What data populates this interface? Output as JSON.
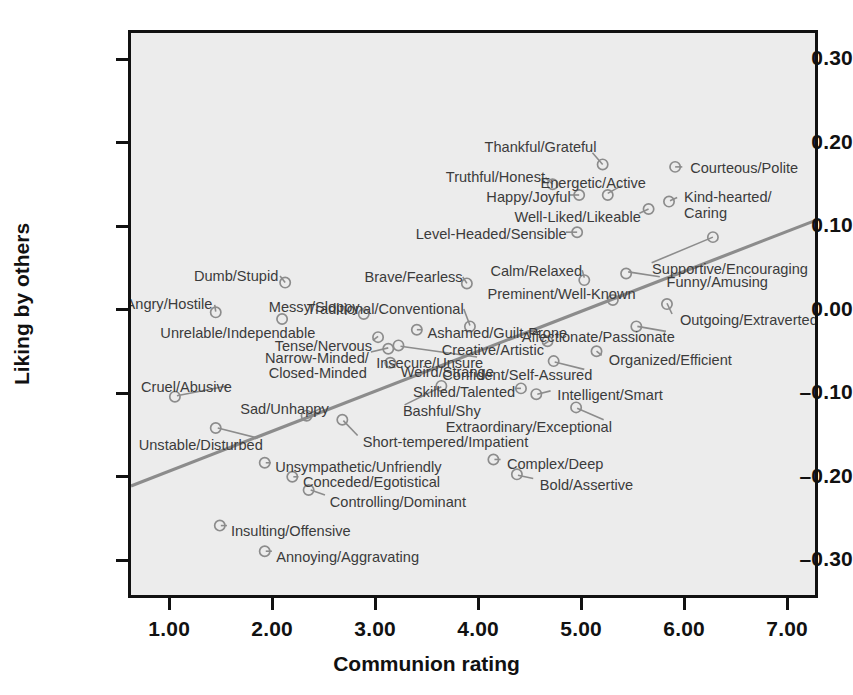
{
  "chart_data": {
    "type": "scatter",
    "title": "",
    "xlabel": "Communion rating",
    "ylabel": "Liking by others",
    "xlim": [
      0.6,
      7.3
    ],
    "ylim": [
      -0.345,
      0.335
    ],
    "xticks": [
      "1.00",
      "2.00",
      "3.00",
      "4.00",
      "5.00",
      "6.00",
      "7.00"
    ],
    "xtick_values": [
      1,
      2,
      3,
      4,
      5,
      6,
      7
    ],
    "yticks": [
      "0.30",
      "0.20",
      "0.10",
      "0.00",
      "-0.10",
      "-0.20",
      "-0.30"
    ],
    "ytick_values": [
      0.3,
      0.2,
      0.1,
      0.0,
      -0.1,
      -0.2,
      -0.3
    ],
    "grid": false,
    "legend": "none",
    "marker": "open-circle",
    "marker_color": "#8c8c8c",
    "plot_background": "#ececec",
    "trendline": {
      "label": "regression-line",
      "color": "#8c8c8c",
      "x1": 0.6,
      "y1": -0.213,
      "x2": 7.3,
      "y2": 0.108
    },
    "points": [
      {
        "label": "Thankful/Grateful",
        "x": 5.22,
        "y": 0.176,
        "lx": 5.12,
        "ly": 0.198,
        "anchor": "right"
      },
      {
        "label": "Courteous/Polite",
        "x": 5.93,
        "y": 0.173,
        "lx": 6.03,
        "ly": 0.173,
        "anchor": "left"
      },
      {
        "label": "Truthful/Honest",
        "x": 4.73,
        "y": 0.152,
        "lx": 4.62,
        "ly": 0.163,
        "anchor": "right"
      },
      {
        "label": "Energetic/Active",
        "x": 5.27,
        "y": 0.139,
        "lx": 5.6,
        "ly": 0.156,
        "anchor": "right"
      },
      {
        "label": "Happy/Joyful",
        "x": 4.99,
        "y": 0.139,
        "lx": 4.87,
        "ly": 0.139,
        "anchor": "right"
      },
      {
        "label": "Kind-hearted/",
        "x": 5.87,
        "y": 0.131,
        "lx": 5.97,
        "ly": 0.139,
        "anchor": "left"
      },
      {
        "label": "Caring",
        "x": null,
        "y": null,
        "lx": 5.97,
        "ly": 0.119,
        "anchor": "left"
      },
      {
        "label": "Well-Liked/Likeable",
        "x": 5.67,
        "y": 0.122,
        "lx": 5.55,
        "ly": 0.115,
        "anchor": "right"
      },
      {
        "label": "Level-Headed/Sensible",
        "x": 4.97,
        "y": 0.094,
        "lx": 4.83,
        "ly": 0.094,
        "anchor": "right"
      },
      {
        "label": "Supportive/Encouraging",
        "x": 6.3,
        "y": 0.088,
        "lx": 5.66,
        "ly": 0.052,
        "anchor": "left"
      },
      {
        "label": "Calm/Relaxed",
        "x": 5.04,
        "y": 0.036,
        "lx": 4.98,
        "ly": 0.05,
        "anchor": "right"
      },
      {
        "label": "Funny/Amusing",
        "x": 5.45,
        "y": 0.044,
        "lx": 5.8,
        "ly": 0.037,
        "anchor": "left"
      },
      {
        "label": "Dumb/Stupid",
        "x": 2.11,
        "y": 0.033,
        "lx": 2.03,
        "ly": 0.044,
        "anchor": "right"
      },
      {
        "label": "Brave/Fearless",
        "x": 3.89,
        "y": 0.032,
        "lx": 3.82,
        "ly": 0.043,
        "anchor": "right"
      },
      {
        "label": "Preminent/Well-Known",
        "x": 5.32,
        "y": 0.012,
        "lx": 5.5,
        "ly": 0.022,
        "anchor": "right"
      },
      {
        "label": "Angry/Hostile",
        "x": 1.43,
        "y": -0.003,
        "lx": 1.39,
        "ly": 0.01,
        "anchor": "right"
      },
      {
        "label": "Messy/Sloppy",
        "x": 2.88,
        "y": -0.005,
        "lx": 2.82,
        "ly": 0.007,
        "anchor": "right"
      },
      {
        "label": "Traditional/Conventional",
        "x": 3.92,
        "y": -0.02,
        "lx": 3.83,
        "ly": 0.004,
        "anchor": "right"
      },
      {
        "label": "Outgoing/Extraverted",
        "x": 5.85,
        "y": 0.007,
        "lx": 5.93,
        "ly": -0.008,
        "anchor": "left"
      },
      {
        "label": "Unrelable/Independable",
        "x": 2.08,
        "y": -0.011,
        "lx": 2.39,
        "ly": -0.024,
        "anchor": "right"
      },
      {
        "label": "Tense/Nervous",
        "x": 3.02,
        "y": -0.033,
        "lx": 2.94,
        "ly": -0.04,
        "anchor": "right"
      },
      {
        "label": "Ashamed/Guilt-Prone",
        "x": 3.4,
        "y": -0.024,
        "lx": 3.48,
        "ly": -0.024,
        "anchor": "left"
      },
      {
        "label": "Affectionate/Passionate",
        "x": 5.55,
        "y": -0.02,
        "lx": 5.88,
        "ly": -0.029,
        "anchor": "right"
      },
      {
        "label": "Narrow-Minded/",
        "x": 3.12,
        "y": -0.047,
        "lx": 2.91,
        "ly": -0.054,
        "anchor": "right"
      },
      {
        "label": "Creative/Artistic",
        "x": 4.68,
        "y": -0.038,
        "lx": 4.61,
        "ly": -0.045,
        "anchor": "right"
      },
      {
        "label": "Insecure/Unsure",
        "x": 3.22,
        "y": -0.043,
        "lx": 4.02,
        "ly": -0.06,
        "anchor": "right"
      },
      {
        "label": "Organized/Efficient",
        "x": 5.16,
        "y": -0.05,
        "lx": 5.24,
        "ly": -0.057,
        "anchor": "left"
      },
      {
        "label": "Closed-Minded",
        "x": null,
        "y": null,
        "lx": 2.89,
        "ly": -0.072,
        "anchor": "right"
      },
      {
        "label": "Weird/Strange",
        "x": 3.14,
        "y": -0.064,
        "lx": 3.22,
        "ly": -0.071,
        "anchor": "left"
      },
      {
        "label": "Confident/Self-Assured",
        "x": 4.74,
        "y": -0.062,
        "lx": 5.08,
        "ly": -0.075,
        "anchor": "right"
      },
      {
        "label": "Cruel/Abusive",
        "x": 1.03,
        "y": -0.105,
        "lx": 1.58,
        "ly": -0.089,
        "anchor": "right"
      },
      {
        "label": "Skilled/Talented",
        "x": 4.42,
        "y": -0.095,
        "lx": 4.33,
        "ly": -0.095,
        "anchor": "right"
      },
      {
        "label": "Intelligent/Smart",
        "x": 4.57,
        "y": -0.102,
        "lx": 4.74,
        "ly": -0.098,
        "anchor": "left"
      },
      {
        "label": "Sad/Unhappy",
        "x": 2.32,
        "y": -0.128,
        "lx": 2.52,
        "ly": -0.115,
        "anchor": "right"
      },
      {
        "label": "Bashful/Shy",
        "x": 3.64,
        "y": -0.092,
        "lx": 3.24,
        "ly": -0.118,
        "anchor": "left"
      },
      {
        "label": "Extraordinary/Exceptional",
        "x": 4.96,
        "y": -0.118,
        "lx": 5.27,
        "ly": -0.137,
        "anchor": "right"
      },
      {
        "label": "Unstable/Disturbed",
        "x": 1.43,
        "y": -0.143,
        "lx": 1.88,
        "ly": -0.158,
        "anchor": "right"
      },
      {
        "label": "Short-tempered/Impatient",
        "x": 2.67,
        "y": -0.133,
        "lx": 2.85,
        "ly": -0.155,
        "anchor": "left"
      },
      {
        "label": "Unsympathetic/Unfriendly",
        "x": 1.91,
        "y": -0.185,
        "lx": 2.0,
        "ly": -0.185,
        "anchor": "left"
      },
      {
        "label": "Complex/Deep",
        "x": 4.15,
        "y": -0.181,
        "lx": 4.25,
        "ly": -0.181,
        "anchor": "left"
      },
      {
        "label": "Conceded/Egotistical",
        "x": 2.18,
        "y": -0.202,
        "lx": 2.27,
        "ly": -0.202,
        "anchor": "left"
      },
      {
        "label": "Bold/Assertive",
        "x": 4.38,
        "y": -0.199,
        "lx": 4.57,
        "ly": -0.206,
        "anchor": "left"
      },
      {
        "label": "Controlling/Dominant",
        "x": 2.34,
        "y": -0.218,
        "lx": 2.53,
        "ly": -0.226,
        "anchor": "left"
      },
      {
        "label": "Insulting/Offensive",
        "x": 1.47,
        "y": -0.261,
        "lx": 1.57,
        "ly": -0.261,
        "anchor": "left"
      },
      {
        "label": "Annoying/Aggravating",
        "x": 1.91,
        "y": -0.292,
        "lx": 2.01,
        "ly": -0.292,
        "anchor": "left"
      }
    ],
    "leaders": [
      {
        "from": [
          5.12,
          0.19
        ],
        "to": [
          5.22,
          0.176
        ]
      },
      {
        "from": [
          6.0,
          0.173
        ],
        "to": [
          5.93,
          0.173
        ]
      },
      {
        "from": [
          4.66,
          0.16
        ],
        "to": [
          4.73,
          0.152
        ]
      },
      {
        "from": [
          5.4,
          0.15
        ],
        "to": [
          5.27,
          0.141
        ]
      },
      {
        "from": [
          4.9,
          0.139
        ],
        "to": [
          4.99,
          0.139
        ]
      },
      {
        "from": [
          5.95,
          0.136
        ],
        "to": [
          5.88,
          0.132
        ]
      },
      {
        "from": [
          5.58,
          0.117
        ],
        "to": [
          5.67,
          0.122
        ]
      },
      {
        "from": [
          4.86,
          0.094
        ],
        "to": [
          4.97,
          0.094
        ]
      },
      {
        "from": [
          5.7,
          0.057
        ],
        "to": [
          6.3,
          0.088
        ]
      },
      {
        "from": [
          5.02,
          0.048
        ],
        "to": [
          5.04,
          0.039
        ]
      },
      {
        "from": [
          5.78,
          0.04
        ],
        "to": [
          5.47,
          0.046
        ]
      },
      {
        "from": [
          2.06,
          0.041
        ],
        "to": [
          2.11,
          0.033
        ]
      },
      {
        "from": [
          3.85,
          0.04
        ],
        "to": [
          3.89,
          0.032
        ]
      },
      {
        "from": [
          5.46,
          0.02
        ],
        "to": [
          5.33,
          0.014
        ]
      },
      {
        "from": [
          1.42,
          0.006
        ],
        "to": [
          1.43,
          -0.002
        ]
      },
      {
        "from": [
          2.85,
          0.004
        ],
        "to": [
          2.89,
          -0.004
        ]
      },
      {
        "from": [
          3.86,
          0.001
        ],
        "to": [
          3.92,
          -0.019
        ]
      },
      {
        "from": [
          5.9,
          -0.005
        ],
        "to": [
          5.85,
          0.008
        ]
      },
      {
        "from": [
          2.97,
          -0.037
        ],
        "to": [
          3.02,
          -0.032
        ]
      },
      {
        "from": [
          3.45,
          -0.024
        ],
        "to": [
          3.4,
          -0.024
        ]
      },
      {
        "from": [
          5.84,
          -0.026
        ],
        "to": [
          5.56,
          -0.02
        ]
      },
      {
        "from": [
          2.95,
          -0.051
        ],
        "to": [
          3.12,
          -0.046
        ]
      },
      {
        "from": [
          4.64,
          -0.042
        ],
        "to": [
          4.69,
          -0.038
        ]
      },
      {
        "from": [
          3.99,
          -0.057
        ],
        "to": [
          3.24,
          -0.044
        ]
      },
      {
        "from": [
          5.21,
          -0.055
        ],
        "to": [
          5.16,
          -0.05
        ]
      },
      {
        "from": [
          3.19,
          -0.07
        ],
        "to": [
          3.14,
          -0.065
        ]
      },
      {
        "from": [
          5.04,
          -0.072
        ],
        "to": [
          4.75,
          -0.063
        ]
      },
      {
        "from": [
          1.54,
          -0.092
        ],
        "to": [
          1.05,
          -0.104
        ]
      },
      {
        "from": [
          4.36,
          -0.095
        ],
        "to": [
          4.42,
          -0.095
        ]
      },
      {
        "from": [
          4.71,
          -0.098
        ],
        "to": [
          4.58,
          -0.102
        ]
      },
      {
        "from": [
          2.48,
          -0.118
        ],
        "to": [
          2.33,
          -0.127
        ]
      },
      {
        "from": [
          3.28,
          -0.115
        ],
        "to": [
          3.64,
          -0.093
        ]
      },
      {
        "from": [
          5.23,
          -0.133
        ],
        "to": [
          4.97,
          -0.119
        ]
      },
      {
        "from": [
          1.84,
          -0.155
        ],
        "to": [
          1.45,
          -0.143
        ]
      },
      {
        "from": [
          2.82,
          -0.152
        ],
        "to": [
          2.68,
          -0.134
        ]
      },
      {
        "from": [
          1.97,
          -0.185
        ],
        "to": [
          1.92,
          -0.185
        ]
      },
      {
        "from": [
          4.22,
          -0.181
        ],
        "to": [
          4.16,
          -0.181
        ]
      },
      {
        "from": [
          2.24,
          -0.202
        ],
        "to": [
          2.19,
          -0.202
        ]
      },
      {
        "from": [
          4.54,
          -0.204
        ],
        "to": [
          4.39,
          -0.2
        ]
      },
      {
        "from": [
          2.5,
          -0.224
        ],
        "to": [
          2.36,
          -0.218
        ]
      },
      {
        "from": [
          1.54,
          -0.261
        ],
        "to": [
          1.48,
          -0.261
        ]
      },
      {
        "from": [
          1.98,
          -0.292
        ],
        "to": [
          1.92,
          -0.292
        ]
      }
    ]
  }
}
